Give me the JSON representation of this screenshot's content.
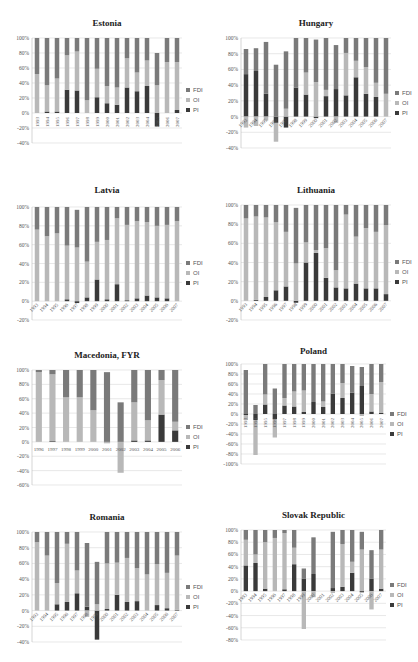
{
  "colors": {
    "FDI": "#7a7a7a",
    "OI": "#b8b8b8",
    "PI": "#3a3a3a",
    "grid": "#d9d9d9",
    "axis": "#555555"
  },
  "legend": [
    "FDI",
    "OI",
    "PI"
  ],
  "chart_data": [
    {
      "type": "bar",
      "stacked": true,
      "title": "Estonia",
      "categories": [
        "1993",
        "1994",
        "1995",
        "1996",
        "1997",
        "1998",
        "1999",
        "2000",
        "2001",
        "2002",
        "2003",
        "2004",
        "2005",
        "2006",
        "2007"
      ],
      "ylim": [
        -40,
        100
      ],
      "yticks": [
        -40,
        -20,
        0,
        20,
        40,
        60,
        80,
        100
      ],
      "xlabel_rot": -90,
      "series": [
        {
          "name": "PI",
          "values": [
            0,
            2,
            2,
            31,
            30,
            0,
            21,
            13,
            11,
            34,
            29,
            36,
            -18,
            0,
            4
          ]
        },
        {
          "name": "OI",
          "values": [
            52,
            35,
            44,
            46,
            52,
            17,
            38,
            23,
            23,
            39,
            25,
            34,
            37,
            68,
            64
          ]
        },
        {
          "name": "FDI",
          "values": [
            48,
            63,
            54,
            23,
            18,
            83,
            41,
            64,
            66,
            27,
            46,
            30,
            43,
            32,
            32
          ]
        }
      ],
      "legend_position": "right"
    },
    {
      "type": "bar",
      "stacked": true,
      "title": "Hungary",
      "categories": [
        "1993",
        "1994",
        "1995",
        "1996",
        "1997",
        "1998",
        "1999",
        "2000",
        "2001",
        "2002",
        "2003",
        "2004",
        "2005",
        "2006",
        "2007"
      ],
      "ylim": [
        -40,
        100
      ],
      "yticks": [
        -40,
        -20,
        0,
        20,
        40,
        60,
        80,
        100
      ],
      "xlabel_rot": -45,
      "series": [
        {
          "name": "PI",
          "values": [
            54,
            58,
            29,
            -8,
            -14,
            37,
            28,
            -2,
            26,
            35,
            27,
            50,
            29,
            25,
            0
          ]
        },
        {
          "name": "OI",
          "values": [
            -14,
            -12,
            -5,
            -24,
            10,
            0,
            28,
            44,
            8,
            -8,
            54,
            21,
            34,
            18,
            29
          ]
        },
        {
          "name": "FDI",
          "values": [
            32,
            29,
            66,
            66,
            73,
            63,
            44,
            54,
            66,
            56,
            19,
            29,
            37,
            57,
            71
          ]
        }
      ],
      "legend_position": "right"
    },
    {
      "type": "bar",
      "stacked": true,
      "title": "Latvia",
      "categories": [
        "1993",
        "1994",
        "1995",
        "1996",
        "1997",
        "1998",
        "1999",
        "2000",
        "2001",
        "2002",
        "2003",
        "2004",
        "2005",
        "2006",
        "2007"
      ],
      "ylim": [
        -20,
        100
      ],
      "yticks": [
        -20,
        0,
        20,
        40,
        60,
        80,
        100
      ],
      "xlabel_rot": -45,
      "series": [
        {
          "name": "PI",
          "values": [
            0,
            0,
            0,
            2,
            -2,
            4,
            23,
            2,
            18,
            1,
            3,
            6,
            4,
            3,
            0
          ]
        },
        {
          "name": "OI",
          "values": [
            76,
            69,
            72,
            57,
            57,
            38,
            40,
            63,
            70,
            80,
            82,
            78,
            76,
            78,
            85
          ]
        },
        {
          "name": "FDI",
          "values": [
            24,
            31,
            28,
            41,
            40,
            58,
            37,
            35,
            12,
            19,
            15,
            16,
            20,
            19,
            15
          ]
        }
      ],
      "legend_position": "right"
    },
    {
      "type": "bar",
      "stacked": true,
      "title": "Lithuania",
      "categories": [
        "1993",
        "1994",
        "1995",
        "1996",
        "1997",
        "1998",
        "1999",
        "2000",
        "2001",
        "2002",
        "2003",
        "2004",
        "2005",
        "2006",
        "2007"
      ],
      "ylim": [
        -20,
        100
      ],
      "yticks": [
        -20,
        0,
        20,
        40,
        60,
        80,
        100
      ],
      "xlabel_rot": -45,
      "series": [
        {
          "name": "PI",
          "values": [
            0,
            1,
            4,
            11,
            15,
            -2,
            40,
            50,
            24,
            14,
            13,
            18,
            13,
            13,
            7
          ]
        },
        {
          "name": "OI",
          "values": [
            86,
            87,
            83,
            71,
            57,
            39,
            21,
            3,
            31,
            18,
            77,
            49,
            63,
            59,
            72
          ]
        },
        {
          "name": "FDI",
          "values": [
            14,
            12,
            13,
            18,
            28,
            58,
            39,
            47,
            45,
            68,
            10,
            33,
            24,
            28,
            21
          ]
        }
      ],
      "legend_position": "right"
    },
    {
      "type": "bar",
      "stacked": true,
      "title": "Macedonia, FYR",
      "categories": [
        "1996",
        "1997",
        "1998",
        "1999",
        "2000",
        "2001",
        "2002",
        "2003",
        "2004",
        "2005",
        "2006"
      ],
      "ylim": [
        -60,
        100
      ],
      "yticks": [
        -60,
        -40,
        -20,
        0,
        20,
        40,
        60,
        80,
        100
      ],
      "xlabel_rot": 0,
      "series": [
        {
          "name": "PI",
          "values": [
            0,
            1,
            0,
            0,
            0,
            0,
            0,
            2,
            2,
            38,
            16
          ]
        },
        {
          "name": "OI",
          "values": [
            97,
            93,
            62,
            62,
            44,
            -2,
            -43,
            53,
            28,
            48,
            12
          ]
        },
        {
          "name": "FDI",
          "values": [
            3,
            6,
            38,
            38,
            56,
            97,
            55,
            45,
            70,
            14,
            72
          ]
        }
      ],
      "legend_position": "right"
    },
    {
      "type": "bar",
      "stacked": true,
      "title": "Poland",
      "categories": [
        "1993",
        "1994",
        "1995",
        "1996",
        "1997",
        "1998",
        "1999",
        "2000",
        "2001",
        "2002",
        "2003",
        "2004",
        "2005",
        "2006",
        "2007"
      ],
      "ylim": [
        -100,
        100
      ],
      "yticks": [
        -100,
        -80,
        -60,
        -40,
        -20,
        0,
        20,
        40,
        60,
        80,
        100
      ],
      "xlabel_rot": -90,
      "series": [
        {
          "name": "PI",
          "values": [
            -2,
            -12,
            19,
            -10,
            17,
            15,
            4,
            24,
            14,
            41,
            32,
            43,
            56,
            5,
            2
          ]
        },
        {
          "name": "OI",
          "values": [
            -10,
            -70,
            20,
            -37,
            15,
            30,
            43,
            0,
            11,
            0,
            30,
            0,
            -4,
            35,
            62
          ]
        },
        {
          "name": "FDI",
          "values": [
            88,
            18,
            61,
            51,
            68,
            55,
            53,
            76,
            75,
            59,
            38,
            53,
            38,
            60,
            36
          ]
        }
      ],
      "legend_position": "right"
    },
    {
      "type": "bar",
      "stacked": true,
      "title": "Romania",
      "categories": [
        "1993",
        "1994",
        "1995",
        "1996",
        "1997",
        "1998",
        "1999",
        "2000",
        "2001",
        "2002",
        "2003",
        "2004",
        "2005",
        "2006",
        "2007"
      ],
      "ylim": [
        -40,
        100
      ],
      "yticks": [
        -40,
        -20,
        0,
        20,
        40,
        60,
        80,
        100
      ],
      "xlabel_rot": -45,
      "series": [
        {
          "name": "PI",
          "values": [
            0,
            0,
            8,
            11,
            22,
            5,
            -37,
            2,
            20,
            11,
            12,
            0,
            7,
            3,
            1
          ]
        },
        {
          "name": "OI",
          "values": [
            87,
            70,
            27,
            74,
            29,
            -8,
            8,
            58,
            41,
            56,
            42,
            46,
            52,
            45,
            69
          ]
        },
        {
          "name": "FDI",
          "values": [
            13,
            30,
            65,
            15,
            49,
            81,
            54,
            40,
            39,
            33,
            46,
            54,
            41,
            52,
            30
          ]
        }
      ],
      "legend_position": "right"
    },
    {
      "type": "bar",
      "stacked": true,
      "title": "Slovak Republic",
      "categories": [
        "1993",
        "1994",
        "1995",
        "1996",
        "1997",
        "1998",
        "1999",
        "2000",
        "2001",
        "2002",
        "2003",
        "2004",
        "2005",
        "2006",
        "2007"
      ],
      "ylim": [
        -80,
        100
      ],
      "yticks": [
        -80,
        -60,
        -40,
        -20,
        0,
        20,
        40,
        60,
        80,
        100
      ],
      "xlabel_rot": -45,
      "series": [
        {
          "name": "PI",
          "values": [
            42,
            46,
            4,
            0,
            3,
            44,
            20,
            28,
            0,
            5,
            7,
            30,
            -2,
            20,
            4
          ]
        },
        {
          "name": "OI",
          "values": [
            42,
            14,
            76,
            87,
            92,
            27,
            -62,
            -10,
            0,
            -3,
            70,
            18,
            68,
            -30,
            64
          ]
        },
        {
          "name": "FDI",
          "values": [
            16,
            40,
            20,
            13,
            5,
            29,
            17,
            60,
            0,
            92,
            23,
            52,
            29,
            47,
            32
          ]
        }
      ],
      "legend_position": "right"
    }
  ],
  "panels": [
    {
      "x": 0,
      "y": 0,
      "plot": {
        "left": 32,
        "top": 38,
        "width": 150,
        "height": 105
      },
      "title_y": 18
    },
    {
      "x": 209,
      "y": 0,
      "plot": {
        "left": 32,
        "top": 38,
        "width": 150,
        "height": 110
      },
      "title_y": 18
    },
    {
      "x": 0,
      "y": 165,
      "plot": {
        "left": 32,
        "top": 42,
        "width": 150,
        "height": 113
      },
      "title_y": 20
    },
    {
      "x": 209,
      "y": 165,
      "plot": {
        "left": 32,
        "top": 40,
        "width": 150,
        "height": 115
      },
      "title_y": 20
    },
    {
      "x": 0,
      "y": 330,
      "plot": {
        "left": 32,
        "top": 40,
        "width": 150,
        "height": 115
      },
      "title_y": 20
    },
    {
      "x": 209,
      "y": 330,
      "plot": {
        "left": 32,
        "top": 34,
        "width": 145,
        "height": 100
      },
      "title_y": 16
    },
    {
      "x": 0,
      "y": 495,
      "plot": {
        "left": 32,
        "top": 37,
        "width": 150,
        "height": 110
      },
      "title_y": 17
    },
    {
      "x": 209,
      "y": 495,
      "plot": {
        "left": 32,
        "top": 35,
        "width": 145,
        "height": 110
      },
      "title_y": 15
    }
  ]
}
